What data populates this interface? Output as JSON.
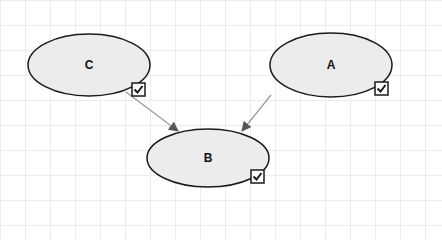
{
  "diagram": {
    "type": "directed-graph",
    "colors": {
      "node_fill": "#ececec",
      "node_stroke": "#1a1a1a",
      "edge_stroke": "#9a9a9a",
      "arrowhead": "#555555",
      "grid": "#ececec",
      "checkbox_stroke": "#1a1a1a"
    },
    "nodes": [
      {
        "id": "C",
        "label": "C",
        "cx": 89,
        "cy": 65,
        "rx": 61,
        "ry": 31,
        "checked": true,
        "checkbox": {
          "x": 132,
          "y": 83,
          "size": 13
        }
      },
      {
        "id": "A",
        "label": "A",
        "cx": 331,
        "cy": 65,
        "rx": 61,
        "ry": 32,
        "checked": true,
        "checkbox": {
          "x": 375,
          "y": 82,
          "size": 13
        }
      },
      {
        "id": "B",
        "label": "B",
        "cx": 208,
        "cy": 158,
        "rx": 61,
        "ry": 29,
        "checked": true,
        "checkbox": {
          "x": 251,
          "y": 170,
          "size": 13
        }
      }
    ],
    "edges": [
      {
        "from": "C",
        "to": "B",
        "x1": 126,
        "y1": 92,
        "x2": 178,
        "y2": 131
      },
      {
        "from": "A",
        "to": "B",
        "x1": 271,
        "y1": 95,
        "x2": 242,
        "y2": 131
      }
    ]
  }
}
